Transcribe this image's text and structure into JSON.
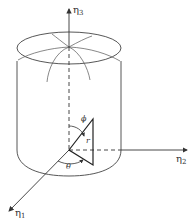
{
  "figure": {
    "type": "spherical coordinate diagram inside cylinder",
    "axes": [
      {
        "id": "eta1",
        "symbol": "η",
        "subscript": "1"
      },
      {
        "id": "eta2",
        "symbol": "η",
        "subscript": "2"
      },
      {
        "id": "eta3",
        "symbol": "η",
        "subscript": "3"
      }
    ],
    "angles": {
      "theta": "θ",
      "phi": "ϕ"
    },
    "radius_label": "r",
    "colors": {
      "line": "#333333",
      "background": "#ffffff"
    }
  }
}
